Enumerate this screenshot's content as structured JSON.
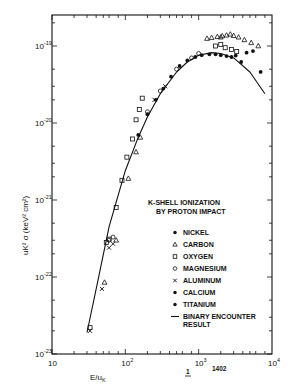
{
  "chart_data": {
    "type": "scatter",
    "title": "K-SHELL IONIZATION BY PROTON IMPACT",
    "title_lines": [
      "K-SHELL IONIZATION",
      "BY PROTON IMPACT"
    ],
    "xlabel": "E/u_K",
    "xlabel_main": "E/u",
    "xlabel_sub": "K",
    "ylabel": "u_K^2 σ (keV^2 cm^2)",
    "xscale": "log",
    "yscale": "log",
    "xlim": [
      10,
      10000
    ],
    "ylim": [
      1e-23,
      1.6e-19
    ],
    "x_ticks": [
      {
        "value": 10,
        "base": "10",
        "exp": ""
      },
      {
        "value": 100,
        "base": "10",
        "exp": "2"
      },
      {
        "value": 1000,
        "base": "10",
        "exp": "3"
      },
      {
        "value": 10000,
        "base": "10",
        "exp": "4"
      }
    ],
    "y_ticks": [
      {
        "value": 1e-19,
        "base": "10",
        "exp": "-19"
      },
      {
        "value": 1e-20,
        "base": "10",
        "exp": "-20"
      },
      {
        "value": 1e-21,
        "base": "10",
        "exp": "-21"
      },
      {
        "value": 1e-22,
        "base": "10",
        "exp": "-22"
      },
      {
        "value": 1e-23,
        "base": "10",
        "exp": "-23"
      }
    ],
    "grid": false,
    "legend_position": "lower right",
    "legend": [
      {
        "name": "NICKEL",
        "marker": "filled-circle"
      },
      {
        "name": "CARBON",
        "marker": "triangle"
      },
      {
        "name": "OXYGEN",
        "marker": "square"
      },
      {
        "name": "MAGNESIUM",
        "marker": "open-circle"
      },
      {
        "name": "ALUMINUM",
        "marker": "cross"
      },
      {
        "name": "CALCIUM",
        "marker": "filled-circle"
      },
      {
        "name": "TITANIUM",
        "marker": "filled-circle"
      },
      {
        "name": "BINARY ENCOUNTER RESULT",
        "marker": "line",
        "label_lines": [
          "BINARY ENCOUNTER",
          "RESULT"
        ]
      }
    ],
    "series": [
      {
        "name": "Binary encounter result",
        "kind": "line",
        "x": [
          30,
          40,
          60,
          100,
          150,
          200,
          300,
          500,
          700,
          1000,
          1500,
          2000,
          3000,
          5000,
          8000
        ],
        "y": [
          1.9e-23,
          7e-23,
          4.5e-22,
          2.4e-21,
          6.5e-21,
          1.2e-20,
          2.4e-20,
          4.6e-20,
          6.2e-20,
          7.6e-20,
          8.2e-20,
          8e-20,
          7e-20,
          4.6e-20,
          2.4e-20
        ]
      },
      {
        "name": "CARBON",
        "marker": "triangle",
        "x": [
          52,
          75,
          110,
          140,
          160,
          1500,
          1800,
          2100,
          2400,
          2700,
          3000,
          3500,
          4200,
          5200,
          6500,
          1300,
          2000
        ],
        "y": [
          8.5e-23,
          3e-22,
          1.9e-21,
          4.2e-21,
          6.5e-21,
          1.28e-19,
          1.32e-19,
          1.35e-19,
          1.38e-19,
          1.42e-19,
          1.36e-19,
          1.3e-19,
          1.2e-19,
          1.1e-19,
          1e-19,
          1.25e-19,
          1.3e-19
        ]
      },
      {
        "name": "OXYGEN",
        "marker": "square",
        "x": [
          33,
          55,
          60,
          75,
          90,
          105,
          125,
          140,
          155,
          170,
          1700,
          2000,
          2300,
          2800,
          3300
        ],
        "y": [
          2.2e-23,
          2.8e-22,
          3.1e-22,
          8e-22,
          1.8e-21,
          3.6e-21,
          6.2e-21,
          1.1e-20,
          1.5e-20,
          2.1e-20,
          1e-19,
          1.05e-19,
          9.5e-20,
          9e-20,
          8.5e-20
        ]
      },
      {
        "name": "MAGNESIUM",
        "marker": "open-circle",
        "x": [
          60,
          68,
          200,
          300,
          500,
          800,
          1000
        ],
        "y": [
          3e-22,
          3.3e-22,
          1.4e-20,
          2.6e-20,
          5e-20,
          7e-20,
          8e-20
        ]
      },
      {
        "name": "ALUMINUM",
        "marker": "cross",
        "x": [
          33,
          48,
          60,
          68,
          250,
          350
        ],
        "y": [
          2e-23,
          7e-23,
          2.4e-22,
          2.7e-22,
          2e-20,
          3e-20
        ]
      },
      {
        "name": "NICKEL / CALCIUM / TITANIUM",
        "marker": "filled-circle",
        "x": [
          150,
          200,
          260,
          330,
          420,
          550,
          700,
          900,
          1100,
          1400,
          1700,
          2000,
          2400,
          2800,
          3200,
          3800,
          4500,
          5500,
          7000
        ],
        "y": [
          7e-21,
          1.3e-20,
          2e-20,
          2.8e-20,
          4e-20,
          5.5e-20,
          6.5e-20,
          7.2e-20,
          7.6e-20,
          7.8e-20,
          7.8e-20,
          7.6e-20,
          7.4e-20,
          7.2e-20,
          7.5e-20,
          6.2e-20,
          8.2e-20,
          8.6e-20,
          4.6e-20
        ]
      }
    ]
  },
  "footer": {
    "page_mark": "1",
    "figure_number": "1402"
  }
}
